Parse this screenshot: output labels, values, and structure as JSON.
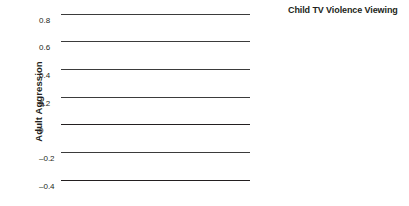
{
  "chart_data": {
    "type": "bar",
    "title": "",
    "xlabel": "",
    "ylabel": "Adult Aggression",
    "categories": [
      "Females",
      "Males"
    ],
    "ylim": [
      -0.4,
      0.8
    ],
    "yticks": [
      "0.8",
      "0.6",
      "0.4",
      "0.2",
      "0",
      "–0.2",
      "–0.4"
    ],
    "ytick_values": [
      0.8,
      0.6,
      0.4,
      0.2,
      0,
      -0.2,
      -0.4
    ],
    "grid": true,
    "legend_position": "right",
    "legend_title": "Child TV Violence Viewing",
    "series": [
      {
        "name": "Low",
        "values": [
          -0.12,
          -0.12
        ]
      },
      {
        "name": "Medium",
        "values": [
          -0.2,
          0.13
        ]
      },
      {
        "name": "High",
        "values": [
          0.17,
          0.45
        ]
      }
    ],
    "bar_color": "#7c7c7c"
  },
  "axis": {
    "y_title": "Adult Aggression",
    "ticks": [
      {
        "label": "0.8",
        "value": 0.8
      },
      {
        "label": "0.6",
        "value": 0.6
      },
      {
        "label": "0.4",
        "value": 0.4
      },
      {
        "label": "0.2",
        "value": 0.2
      },
      {
        "label": "0",
        "value": 0
      },
      {
        "label": "–0.2",
        "value": -0.2
      },
      {
        "label": "–0.4",
        "value": -0.4
      }
    ],
    "categories": [
      {
        "label": "Females"
      },
      {
        "label": "Males"
      }
    ]
  },
  "legend": {
    "title": "Child TV Violence Viewing",
    "items": [
      {
        "label": "Low",
        "color": "#7c7c7c"
      },
      {
        "label": "Medium",
        "color": "#7c7c7c"
      },
      {
        "label": "High",
        "color": "#7c7c7c"
      }
    ]
  }
}
